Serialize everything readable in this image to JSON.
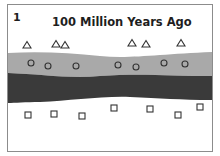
{
  "panel": {
    "number": "1",
    "title": "100 Million Years Ago"
  },
  "layers": [
    {
      "name": "top-layer",
      "fossil_symbol": "triangle",
      "fill": "#ffffff",
      "fossil_count": 7
    },
    {
      "name": "light-gray-layer",
      "fossil_symbol": "circle",
      "fill": "#a9a9a9",
      "fossil_count": 7
    },
    {
      "name": "dark-rock-layer",
      "fossil_symbol": "none",
      "fill": "#3a3a3a",
      "fossil_count": 0
    },
    {
      "name": "bottom-layer",
      "fossil_symbol": "square",
      "fill": "#ffffff",
      "fossil_count": 7
    }
  ],
  "colors": {
    "frame": "#8c8c8c",
    "symbol_stroke": "#333333",
    "light_layer": "#a9a9a9",
    "dark_layer": "#3a3a3a"
  }
}
